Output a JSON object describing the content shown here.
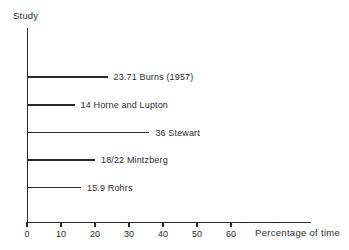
{
  "chart_data": {
    "type": "bar",
    "orientation": "horizontal",
    "title": "",
    "xlabel": "Percentage of time",
    "ylabel": "Study",
    "xlim": [
      0,
      70
    ],
    "xticks": [
      0,
      10,
      20,
      30,
      40,
      50,
      60
    ],
    "xtick_labels": [
      "0",
      "10",
      "20",
      "30",
      "40",
      "50",
      "60"
    ],
    "grid": false,
    "legend": false,
    "categories": [
      "Burns (1957)",
      "Horne and Lupton",
      "Stewart",
      "Mintzberg",
      "Rohrs"
    ],
    "values": [
      23.71,
      14,
      36,
      20,
      15.9
    ],
    "bars": [
      {
        "label": "23.71 Burns (1957)",
        "value_text": "23.71",
        "study": "Burns (1957)",
        "value": 23.71
      },
      {
        "label": "14 Horne and Lupton",
        "value_text": "14",
        "study": "Horne and Lupton",
        "value": 14
      },
      {
        "label": "36 Stewart",
        "value_text": "36",
        "study": "Stewart",
        "value": 36
      },
      {
        "label": "18/22 Mintzberg",
        "value_text": "18/22",
        "study": "Mintzberg",
        "value": 20
      },
      {
        "label": "15.9 Rohrs",
        "value_text": "15.9",
        "study": "Rohrs",
        "value": 15.9
      }
    ]
  },
  "colors": {
    "background": "#ffffff",
    "ink": "#2a2a2a",
    "text": "#2b2b2b"
  }
}
